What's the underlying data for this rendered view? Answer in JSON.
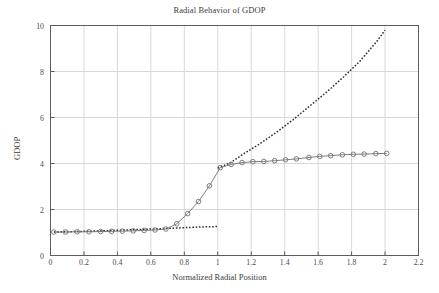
{
  "chart_data": {
    "type": "line",
    "title": "Radial Behavior of GDOP",
    "xlabel": "Normalized Radial Position",
    "ylabel": "GDOP",
    "xlim": [
      0,
      2.2
    ],
    "ylim": [
      0,
      10
    ],
    "xticks": [
      0,
      0.2,
      0.4,
      0.6,
      0.8,
      1,
      1.2,
      1.4,
      1.6,
      1.8,
      2,
      2.2
    ],
    "xtick_labels": [
      "0",
      "0.2",
      "0.4",
      "0.6",
      "0.8",
      "1",
      "1.2",
      "1.4",
      "1.6",
      "1.8",
      "2",
      "2.2"
    ],
    "yticks": [
      0,
      2,
      4,
      6,
      8,
      10
    ],
    "ytick_labels": [
      "0",
      "2",
      "4",
      "6",
      "8",
      "10"
    ],
    "grid": true,
    "legend": "none",
    "colors": {
      "axis": "#5c5c5c",
      "grid": "#d8d8d8",
      "marker_series": "#707070",
      "dashed_series": "#2f2f2f",
      "background": "#ffffff"
    },
    "series": [
      {
        "name": "GDOP with circle markers",
        "style": "solid-with-open-circle-markers",
        "color": "#707070",
        "marker": "open-circle",
        "x": [
          0.02,
          0.09,
          0.16,
          0.23,
          0.3,
          0.365,
          0.43,
          0.495,
          0.56,
          0.625,
          0.69,
          0.755,
          0.82,
          0.885,
          0.95,
          1.015,
          1.08,
          1.145,
          1.21,
          1.275,
          1.34,
          1.405,
          1.47,
          1.545,
          1.61,
          1.675,
          1.745,
          1.81,
          1.875,
          1.945,
          2.01
        ],
        "y": [
          1.02,
          1.02,
          1.03,
          1.03,
          1.04,
          1.05,
          1.06,
          1.07,
          1.09,
          1.11,
          1.15,
          1.38,
          1.82,
          2.35,
          3.03,
          3.82,
          3.96,
          4.04,
          4.08,
          4.09,
          4.12,
          4.16,
          4.2,
          4.26,
          4.31,
          4.34,
          4.38,
          4.4,
          4.41,
          4.43,
          4.44
        ]
      },
      {
        "name": "GDOP asymptotic dashed",
        "style": "dashed",
        "color": "#2f2f2f",
        "marker": "none",
        "x": [
          0.02,
          0.15,
          0.3,
          0.45,
          0.6,
          0.7,
          0.8,
          0.9,
          1.0,
          1.02,
          1.08,
          1.15,
          1.25,
          1.35,
          1.45,
          1.55,
          1.65,
          1.75,
          1.85,
          1.95,
          2.0
        ],
        "y": [
          1.02,
          1.04,
          1.07,
          1.11,
          1.15,
          1.18,
          1.21,
          1.24,
          1.26,
          3.8,
          4.05,
          4.4,
          4.85,
          5.35,
          5.9,
          6.5,
          7.1,
          7.75,
          8.45,
          9.3,
          9.8
        ]
      }
    ],
    "segments": {
      "dashed_lower_branch": {
        "x": [
          0.02,
          0.15,
          0.3,
          0.45,
          0.6,
          0.7,
          0.8,
          0.9,
          1.0
        ],
        "y": [
          1.02,
          1.04,
          1.07,
          1.11,
          1.15,
          1.18,
          1.21,
          1.24,
          1.26
        ]
      },
      "dashed_upper_branch": {
        "x": [
          1.0,
          1.08,
          1.15,
          1.25,
          1.35,
          1.45,
          1.55,
          1.65,
          1.75,
          1.85,
          1.95,
          2.0
        ],
        "y": [
          3.8,
          4.05,
          4.4,
          4.85,
          5.35,
          5.9,
          6.5,
          7.1,
          7.75,
          8.45,
          9.3,
          9.8
        ]
      }
    }
  }
}
